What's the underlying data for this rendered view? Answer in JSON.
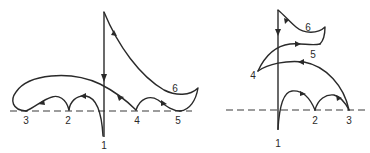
{
  "colors": {
    "line": "#2a2a2a",
    "background": "#ffffff"
  },
  "left_diagram": {
    "labels": {
      "p1": "1",
      "p2": "2",
      "p3": "3",
      "p4": "4",
      "p5": "5",
      "p6": "6"
    }
  },
  "right_diagram": {
    "labels": {
      "p1": "1",
      "p2": "2",
      "p3": "3",
      "p4": "4",
      "p5": "5",
      "p6": "6"
    }
  }
}
